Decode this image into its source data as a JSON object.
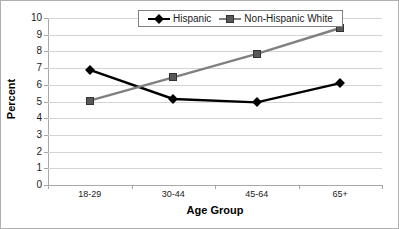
{
  "chart_data": {
    "type": "line",
    "title": "",
    "xlabel": "Age Group",
    "ylabel": "Percent",
    "categories": [
      "18-29",
      "30-44",
      "45-64",
      "65+"
    ],
    "ylim": [
      0,
      10
    ],
    "yticks": [
      "10",
      "9",
      "8",
      "7",
      "6",
      "5",
      "4",
      "3",
      "2",
      "1",
      "0"
    ],
    "grid": true,
    "legend_position": "top-right",
    "series": [
      {
        "name": "Hispanic",
        "marker": "diamond",
        "color": "#000000",
        "values": [
          6.9,
          5.15,
          4.95,
          6.1
        ]
      },
      {
        "name": "Non-Hispanic White",
        "marker": "square",
        "color": "#808080",
        "values": [
          5.05,
          6.45,
          7.85,
          9.4
        ]
      }
    ]
  },
  "legend": {
    "entries": [
      {
        "label": "Hispanic"
      },
      {
        "label": "Non-Hispanic White"
      }
    ]
  },
  "colors": {
    "hispanic": "#000000",
    "non_hispanic_white": "#808080",
    "gridline": "#d4d4d4",
    "axis": "#a8a8a8",
    "border": "#b0b0b0"
  }
}
